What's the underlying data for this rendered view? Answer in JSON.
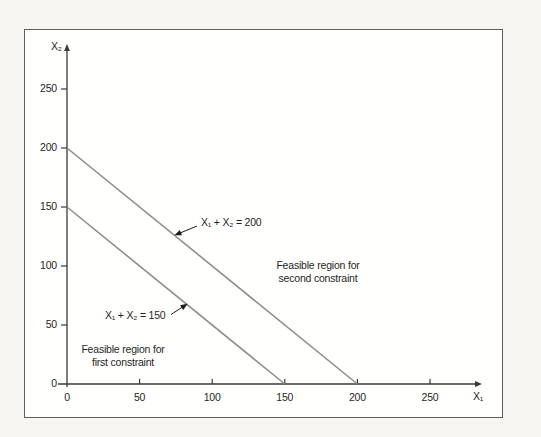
{
  "figure": {
    "outer_background": "#f6f5f1",
    "plot_background": "#fffffd",
    "frame_border_color": "#5e5e5e",
    "axis_color": "#3a3a3a",
    "line_color": "#8e8e8e",
    "arrow_color": "#1c1c1c"
  },
  "chart_data": {
    "type": "line",
    "title": "",
    "xlabel": "X₁",
    "ylabel": "X₂",
    "xlim": [
      0,
      286
    ],
    "ylim": [
      0,
      287
    ],
    "x_ticks": [
      0,
      50,
      100,
      150,
      200,
      250
    ],
    "y_ticks": [
      0,
      50,
      100,
      150,
      200,
      250
    ],
    "grid": false,
    "legend": "none",
    "series": [
      {
        "name": "X₁ + X₂ = 200",
        "points": [
          [
            0,
            200
          ],
          [
            200,
            0
          ]
        ]
      },
      {
        "name": "X₁ + X₂ = 150",
        "points": [
          [
            0,
            150
          ],
          [
            150,
            0
          ]
        ]
      }
    ],
    "annotations": [
      {
        "text": "X₁ + X₂ = 200",
        "arrow_to": [
          74,
          126
        ]
      },
      {
        "text": "X₁ + X₂ = 150",
        "arrow_to": [
          83,
          68
        ]
      }
    ],
    "region_labels": [
      {
        "lines": [
          "Feasible region for",
          "second constraint"
        ]
      },
      {
        "lines": [
          "Feasible region for",
          "first constraint"
        ]
      }
    ]
  }
}
